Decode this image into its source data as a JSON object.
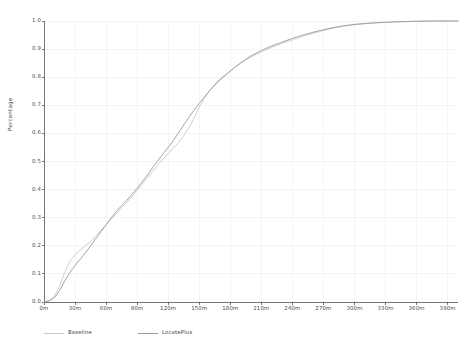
{
  "chart_data": {
    "type": "line",
    "title": "",
    "xlabel": "",
    "ylabel": "Percentage",
    "xlim": [
      0,
      400
    ],
    "ylim": [
      0.0,
      1.0
    ],
    "grid": true,
    "legend_position": "below-left",
    "x_tick_labels": [
      "0m",
      "30m",
      "60m",
      "90m",
      "120m",
      "150m",
      "180m",
      "210m",
      "240m",
      "270m",
      "300m",
      "330m",
      "360m",
      "390m"
    ],
    "x_tick_values": [
      0,
      30,
      60,
      90,
      120,
      150,
      180,
      210,
      240,
      270,
      300,
      330,
      360,
      390
    ],
    "y_tick_labels": [
      "0.0",
      "0.1",
      "0.2",
      "0.3",
      "0.4",
      "0.5",
      "0.6",
      "0.7",
      "0.8",
      "0.9",
      "1.0"
    ],
    "y_tick_values": [
      0.0,
      0.1,
      0.2,
      0.3,
      0.4,
      0.5,
      0.6,
      0.7,
      0.8,
      0.9,
      1.0
    ],
    "x": [
      0,
      5,
      10,
      15,
      20,
      25,
      30,
      35,
      40,
      45,
      50,
      55,
      60,
      65,
      70,
      75,
      80,
      85,
      90,
      95,
      100,
      105,
      110,
      115,
      120,
      125,
      130,
      135,
      140,
      145,
      150,
      155,
      160,
      165,
      170,
      175,
      180,
      185,
      190,
      195,
      200,
      210,
      220,
      230,
      240,
      250,
      260,
      270,
      280,
      290,
      300,
      320,
      340,
      360,
      380,
      400
    ],
    "series": [
      {
        "name": "Baseline",
        "color": "#c9c9c9",
        "values": [
          0.0,
          0.005,
          0.02,
          0.055,
          0.105,
          0.145,
          0.168,
          0.185,
          0.2,
          0.215,
          0.235,
          0.255,
          0.275,
          0.295,
          0.315,
          0.335,
          0.355,
          0.375,
          0.397,
          0.42,
          0.443,
          0.465,
          0.487,
          0.508,
          0.528,
          0.548,
          0.568,
          0.592,
          0.62,
          0.655,
          0.695,
          0.725,
          0.752,
          0.775,
          0.793,
          0.808,
          0.822,
          0.836,
          0.849,
          0.861,
          0.872,
          0.89,
          0.906,
          0.92,
          0.933,
          0.945,
          0.956,
          0.966,
          0.975,
          0.982,
          0.987,
          0.993,
          0.997,
          0.999,
          1.0,
          1.0
        ]
      },
      {
        "name": "LocatePlus",
        "color": "#9a9a9a",
        "values": [
          0.0,
          0.004,
          0.015,
          0.04,
          0.075,
          0.105,
          0.13,
          0.152,
          0.175,
          0.2,
          0.225,
          0.25,
          0.275,
          0.3,
          0.322,
          0.343,
          0.362,
          0.383,
          0.405,
          0.428,
          0.452,
          0.478,
          0.503,
          0.527,
          0.55,
          0.575,
          0.602,
          0.63,
          0.657,
          0.683,
          0.707,
          0.73,
          0.752,
          0.772,
          0.79,
          0.806,
          0.822,
          0.837,
          0.851,
          0.864,
          0.876,
          0.895,
          0.911,
          0.925,
          0.938,
          0.95,
          0.96,
          0.969,
          0.977,
          0.983,
          0.988,
          0.994,
          0.997,
          0.999,
          1.0,
          1.0
        ]
      }
    ]
  },
  "styling": {
    "axis_color": "#555555",
    "grid_color": "#ececec",
    "tick_text_color": "#4a4a4a",
    "background": "#ffffff"
  }
}
